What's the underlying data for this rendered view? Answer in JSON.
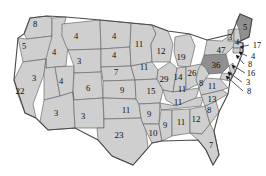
{
  "chart_data": {
    "type": "map",
    "title": "",
    "subtitle": "",
    "region": "United States",
    "map_style": "choropleth-state-values",
    "legend": [],
    "colors": {
      "state_fill_light": "#cfcfcf",
      "state_fill_dark": "#8f8f8f",
      "state_border": "#6b6b6b",
      "outer_border": "#4a4a4a",
      "water_fill": "#ffffff",
      "label_text": "#0d0d0d",
      "leader_line": "#111111",
      "background": "#ffffff"
    },
    "highlighted_states": [
      "Pennsylvania",
      "Maine"
    ],
    "states": [
      {
        "code": "WA",
        "name": "Washington",
        "value": 8,
        "x": 35,
        "y": 24,
        "shade": "light",
        "leader": false
      },
      {
        "code": "OR",
        "name": "Oregon",
        "value": 5,
        "x": 24,
        "y": 46,
        "shade": "light",
        "leader": false
      },
      {
        "code": "CA",
        "name": "California",
        "value": 22,
        "x": 20,
        "y": 91,
        "shade": "light",
        "leader": false
      },
      {
        "code": "ID",
        "name": "Idaho",
        "value": 4,
        "x": 54,
        "y": 52,
        "shade": "light",
        "leader": false
      },
      {
        "code": "NV",
        "name": "Nevada",
        "value": 3,
        "x": 34,
        "y": 78,
        "shade": "light",
        "leader": false
      },
      {
        "code": "UT",
        "name": "Utah",
        "value": 4,
        "x": 61,
        "y": 81,
        "shade": "light",
        "leader": false
      },
      {
        "code": "AZ",
        "name": "Arizona",
        "value": 3,
        "x": 56,
        "y": 113,
        "shade": "light",
        "leader": false
      },
      {
        "code": "MT",
        "name": "Montana",
        "value": 4,
        "x": 76,
        "y": 36,
        "shade": "light",
        "leader": false
      },
      {
        "code": "WY",
        "name": "Wyoming",
        "value": 3,
        "x": 79,
        "y": 61,
        "shade": "light",
        "leader": false
      },
      {
        "code": "CO",
        "name": "Colorado",
        "value": 6,
        "x": 88,
        "y": 88,
        "shade": "light",
        "leader": false
      },
      {
        "code": "NM",
        "name": "New Mexico",
        "value": 3,
        "x": 83,
        "y": 116,
        "shade": "light",
        "leader": false
      },
      {
        "code": "ND",
        "name": "North Dakota",
        "value": 4,
        "x": 114,
        "y": 36,
        "shade": "light",
        "leader": false
      },
      {
        "code": "SD",
        "name": "South Dakota",
        "value": 4,
        "x": 114,
        "y": 55,
        "shade": "light",
        "leader": false
      },
      {
        "code": "NE",
        "name": "Nebraska",
        "value": 7,
        "x": 116,
        "y": 72,
        "shade": "light",
        "leader": false
      },
      {
        "code": "KS",
        "name": "Kansas",
        "value": 9,
        "x": 122,
        "y": 90,
        "shade": "light",
        "leader": false
      },
      {
        "code": "OK",
        "name": "Oklahoma",
        "value": 11,
        "x": 126,
        "y": 110,
        "shade": "light",
        "leader": false
      },
      {
        "code": "TX",
        "name": "Texas",
        "value": 23,
        "x": 119,
        "y": 135,
        "shade": "light",
        "leader": false
      },
      {
        "code": "MN",
        "name": "Minnesota",
        "value": 11,
        "x": 139,
        "y": 44,
        "shade": "light",
        "leader": false
      },
      {
        "code": "IA",
        "name": "Iowa",
        "value": 11,
        "x": 144,
        "y": 67,
        "shade": "light",
        "leader": false
      },
      {
        "code": "MO",
        "name": "Missouri",
        "value": 15,
        "x": 151,
        "y": 91,
        "shade": "light",
        "leader": false
      },
      {
        "code": "AR",
        "name": "Arkansas",
        "value": 9,
        "x": 149,
        "y": 114,
        "shade": "light",
        "leader": false
      },
      {
        "code": "LA",
        "name": "Louisiana",
        "value": 10,
        "x": 153,
        "y": 133,
        "shade": "light",
        "leader": false
      },
      {
        "code": "WI",
        "name": "Wisconsin",
        "value": 12,
        "x": 161,
        "y": 51,
        "shade": "light",
        "leader": false
      },
      {
        "code": "IL",
        "name": "Illinois",
        "value": 29,
        "x": 164,
        "y": 79,
        "shade": "light",
        "leader": false
      },
      {
        "code": "MI",
        "name": "Michigan",
        "value": 19,
        "x": 181,
        "y": 57,
        "shade": "light",
        "leader": false
      },
      {
        "code": "IN",
        "name": "Indiana",
        "value": 14,
        "x": 178,
        "y": 77,
        "shade": "light",
        "leader": false
      },
      {
        "code": "OH",
        "name": "Ohio",
        "value": 26,
        "x": 192,
        "y": 73,
        "shade": "light",
        "leader": false
      },
      {
        "code": "KY",
        "name": "Kentucky",
        "value": 11,
        "x": 178,
        "y": 102,
        "shade": "light",
        "leader": false
      },
      {
        "code": "TN",
        "name": "Tennessee",
        "value": 11,
        "x": 182,
        "y": 89,
        "shade": "light",
        "leader": false
      },
      {
        "code": "MS",
        "name": "Mississippi",
        "value": 9,
        "x": 165,
        "y": 125,
        "shade": "light",
        "leader": false
      },
      {
        "code": "AL",
        "name": "Alabama",
        "value": 11,
        "x": 181,
        "y": 122,
        "shade": "light",
        "leader": false
      },
      {
        "code": "GA",
        "name": "Georgia",
        "value": 12,
        "x": 196,
        "y": 119,
        "shade": "light",
        "leader": false
      },
      {
        "code": "FL",
        "name": "Florida",
        "value": 7,
        "x": 211,
        "y": 145,
        "shade": "light",
        "leader": false
      },
      {
        "code": "SC",
        "name": "South Carolina",
        "value": 8,
        "x": 209,
        "y": 110,
        "shade": "light",
        "leader": false
      },
      {
        "code": "NC",
        "name": "North Carolina",
        "value": 13,
        "x": 212,
        "y": 99,
        "shade": "light",
        "leader": false
      },
      {
        "code": "VA",
        "name": "Virginia",
        "value": 11,
        "x": 212,
        "y": 86,
        "shade": "light",
        "leader": false
      },
      {
        "code": "WV",
        "name": "West Virginia",
        "value": 8,
        "x": 201,
        "y": 83,
        "shade": "light",
        "leader": false
      },
      {
        "code": "PA",
        "name": "Pennsylvania",
        "value": 36,
        "x": 216,
        "y": 65,
        "shade": "dark",
        "leader": false
      },
      {
        "code": "NY",
        "name": "New York",
        "value": 47,
        "x": 221,
        "y": 50,
        "shade": "light",
        "leader": false
      },
      {
        "code": "VT",
        "name": "Vermont",
        "value": 3,
        "x": 230,
        "y": 37,
        "shade": "light",
        "leader": false
      },
      {
        "code": "NH",
        "name": "New Hampshire",
        "value": 4,
        "x": 237,
        "y": 42,
        "shade": "light",
        "leader": false
      },
      {
        "code": "ME",
        "name": "Maine",
        "value": 5,
        "x": 245,
        "y": 27,
        "shade": "dark",
        "leader": false
      }
    ],
    "leader_labels": [
      {
        "code": "MA",
        "name": "Massachusetts",
        "value": 17,
        "x": 257,
        "y": 45,
        "anchor_x": 240,
        "anchor_y": 47
      },
      {
        "code": "RI",
        "name": "Rhode Island",
        "value": 4,
        "x": 253,
        "y": 56,
        "anchor_x": 239,
        "anchor_y": 52
      },
      {
        "code": "CT",
        "name": "Connecticut",
        "value": 8,
        "x": 250,
        "y": 64,
        "anchor_x": 236,
        "anchor_y": 55
      },
      {
        "code": "NJ",
        "name": "New Jersey",
        "value": 16,
        "x": 251,
        "y": 73,
        "anchor_x": 232,
        "anchor_y": 65
      },
      {
        "code": "DE",
        "name": "Delaware",
        "value": 3,
        "x": 248,
        "y": 82,
        "anchor_x": 228,
        "anchor_y": 72
      },
      {
        "code": "MD",
        "name": "Maryland",
        "value": 8,
        "x": 249,
        "y": 91,
        "anchor_x": 226,
        "anchor_y": 76
      }
    ]
  }
}
